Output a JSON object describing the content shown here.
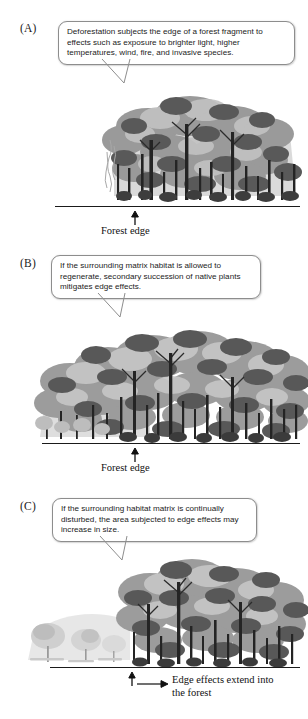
{
  "figure": {
    "colors": {
      "ink": "#1a1a1a",
      "bubble_border": "#8d8d8d",
      "bubble_fill": "#ffffff",
      "canopy_dark": "#5d5d5d",
      "canopy_mid": "#8a8a8a",
      "canopy_light": "#b9b9b9",
      "canopy_pale": "#d8d8d8",
      "trunk": "#262626",
      "ground": "#1a1a1a"
    }
  },
  "panels": [
    {
      "label": "(A)",
      "callout": "Deforestation subjects the edge of a forest fragment to effects such as exposure to brighter light, higher temperatures, wind, fire, and invasive species.",
      "caption": "Forest edge",
      "caption_secondary": "",
      "arrow_up": "up-arrow-icon",
      "arrow_right": ""
    },
    {
      "label": "(B)",
      "callout": "If the surrounding matrix habitat is allowed to regenerate, secondary succession of native plants mitigates edge effects.",
      "caption": "Forest edge",
      "caption_secondary": "",
      "arrow_up": "up-arrow-icon",
      "arrow_right": ""
    },
    {
      "label": "(C)",
      "callout": "If the surrounding habitat matrix is continually disturbed, the area subjected to edge effects may increase in size.",
      "caption": "Edge effects extend into",
      "caption_secondary": "the forest",
      "arrow_up": "up-arrow-icon",
      "arrow_right": "right-arrow-icon"
    }
  ]
}
